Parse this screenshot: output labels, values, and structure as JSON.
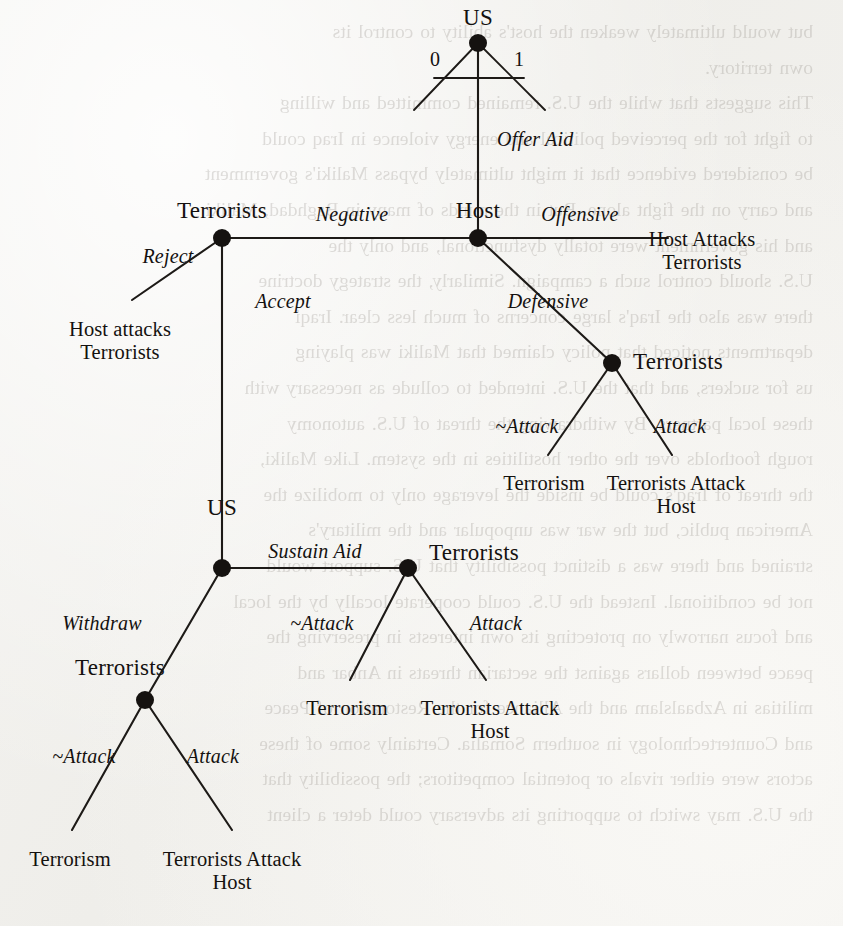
{
  "document": {
    "type": "scanned-book-page",
    "figure_kind": "extensive-form game tree",
    "background_color": "#f2f1ee",
    "ink_color": "#14110f"
  },
  "bleed_through_text": [
    "but would ultimately weaken the host's ability to control its",
    "own territory.",
    "This suggests that while the U.S. remained committed and willing",
    "to fight for the perceived political and energy violence in Iraq could",
    "be considered evidence that it might ultimately bypass Maliki's government",
    "and carry on the fight alone. But in the minds of many in Baghdad, Maliki",
    "and his government were totally dysfunctional, and only the",
    "U.S. should control such a campaign. Similarly, the strategy doctrine",
    "there was also the Iraq's large concerns of much less clear. Iraqi",
    "departments noticed that policy claimed that Maliki was playing",
    "us for suckers, and that the U.S. intended to collude as necessary with",
    "these local partners. By withdrawing the threat of U.S. autonomy",
    "rough footholds over the other hostilities in the system. Like Maliki,",
    "the threat of Iraq's could be inside the leverage only to mobilize the",
    "American public, but the war was unpopular and the military's",
    "strained and there was a distinct possibility that U.S. support would",
    "not be conditional. Instead the U.S. could cooperate locally by the local",
    "and focus narrowly on protecting its own interests in preserving the",
    "peace between dollars against the sectarian threats in Anbar and",
    "militias in Azbaalslam and the Alliance for the Restoration of Peace",
    "and Countertechnology in southern Somalia. Certainly some of these",
    "actors were either rivals or potential competitors; the possibility that",
    "the U.S. may switch to supporting its adversary could deter a client"
  ],
  "tree": {
    "nodes": [
      {
        "id": "root",
        "player_label": "US",
        "x": 478,
        "y": 43,
        "label_x": 478,
        "label_y": 5,
        "label_anchor": "center"
      },
      {
        "id": "host",
        "player_label": "Host",
        "x": 478,
        "y": 238,
        "label_x": 478,
        "label_y": 198,
        "label_anchor": "center"
      },
      {
        "id": "terr_left",
        "player_label": "Terrorists",
        "x": 222,
        "y": 238,
        "label_x": 222,
        "label_y": 198,
        "label_anchor": "center"
      },
      {
        "id": "terr_right",
        "player_label": "Terrorists",
        "x": 612,
        "y": 363,
        "label_x": 678,
        "label_y": 349,
        "label_anchor": "center"
      },
      {
        "id": "us_lower",
        "player_label": "US",
        "x": 222,
        "y": 568,
        "label_x": 222,
        "label_y": 495,
        "label_anchor": "center"
      },
      {
        "id": "terr_mid",
        "player_label": "Terrorists",
        "x": 408,
        "y": 568,
        "label_x": 474,
        "label_y": 540,
        "label_anchor": "center"
      },
      {
        "id": "terr_bottom",
        "player_label": "Terrorists",
        "x": 145,
        "y": 700,
        "label_x": 120,
        "label_y": 655,
        "label_anchor": "center"
      }
    ],
    "chance_branch_labels": [
      {
        "text": "0",
        "x": 435,
        "y": 48
      },
      {
        "text": "1",
        "x": 519,
        "y": 48
      }
    ],
    "action_labels": [
      {
        "text": "Offer Aid",
        "x": 497,
        "y": 128,
        "anchor": "left"
      },
      {
        "text": "Negative",
        "x": 352,
        "y": 203,
        "anchor": "center"
      },
      {
        "text": "Offensive",
        "x": 580,
        "y": 203,
        "anchor": "center"
      },
      {
        "text": "Reject",
        "x": 168,
        "y": 245,
        "anchor": "center"
      },
      {
        "text": "Accept",
        "x": 283,
        "y": 290,
        "anchor": "center"
      },
      {
        "text": "Defensive",
        "x": 548,
        "y": 290,
        "anchor": "center"
      },
      {
        "text": "~Attack",
        "x": 527,
        "y": 415,
        "anchor": "center"
      },
      {
        "text": "Attack",
        "x": 680,
        "y": 415,
        "anchor": "center"
      },
      {
        "text": "Sustain Aid",
        "x": 315,
        "y": 540,
        "anchor": "center"
      },
      {
        "text": "~Attack",
        "x": 322,
        "y": 612,
        "anchor": "center"
      },
      {
        "text": "Attack",
        "x": 496,
        "y": 612,
        "anchor": "center"
      },
      {
        "text": "Withdraw",
        "x": 102,
        "y": 612,
        "anchor": "center"
      },
      {
        "text": "~Attack",
        "x": 84,
        "y": 745,
        "anchor": "center"
      },
      {
        "text": "Attack",
        "x": 213,
        "y": 745,
        "anchor": "center"
      }
    ],
    "outcome_labels": [
      {
        "text": "Host Attacks\nTerrorists",
        "x": 702,
        "y": 228,
        "anchor": "center"
      },
      {
        "text": "Host attacks\nTerrorists",
        "x": 120,
        "y": 318,
        "anchor": "center"
      },
      {
        "text": "Terrorism",
        "x": 544,
        "y": 472,
        "anchor": "center"
      },
      {
        "text": "Terrorists Attack\nHost",
        "x": 676,
        "y": 472,
        "anchor": "center"
      },
      {
        "text": "Terrorism",
        "x": 347,
        "y": 697,
        "anchor": "center"
      },
      {
        "text": "Terrorists Attack\nHost",
        "x": 490,
        "y": 697,
        "anchor": "center"
      },
      {
        "text": "Terrorism",
        "x": 70,
        "y": 848,
        "anchor": "center"
      },
      {
        "text": "Terrorists Attack\nHost",
        "x": 232,
        "y": 848,
        "anchor": "center"
      }
    ],
    "edges": [
      {
        "from": "root",
        "to": "host",
        "kind": "straight"
      },
      {
        "from": "host",
        "to": "terr_left",
        "kind": "straight"
      },
      {
        "from": "host",
        "to": "host-attacks-right",
        "kind": "straight"
      },
      {
        "from": "host",
        "to": "terr_right",
        "kind": "straight"
      },
      {
        "from": "terr_left",
        "to": "host-attacks-left",
        "kind": "straight"
      },
      {
        "from": "terr_left",
        "to": "us_lower",
        "kind": "straight"
      },
      {
        "from": "terr_right",
        "to": "terrorism-r",
        "kind": "straight"
      },
      {
        "from": "terr_right",
        "to": "terrattack-r",
        "kind": "straight"
      },
      {
        "from": "us_lower",
        "to": "terr_mid",
        "kind": "straight"
      },
      {
        "from": "us_lower",
        "to": "terr_bottom",
        "kind": "straight"
      },
      {
        "from": "terr_mid",
        "to": "terrorism-m",
        "kind": "straight"
      },
      {
        "from": "terr_mid",
        "to": "terrattack-m",
        "kind": "straight"
      },
      {
        "from": "terr_bottom",
        "to": "terrorism-b",
        "kind": "straight"
      },
      {
        "from": "terr_bottom",
        "to": "terrattack-b",
        "kind": "straight"
      }
    ]
  }
}
